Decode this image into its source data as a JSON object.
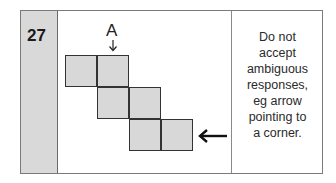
{
  "question": {
    "number": "27",
    "label": "A",
    "answer_note_lines": [
      "Do not",
      "accept",
      "ambiguous",
      "responses,",
      "eg arrow",
      "pointing to",
      "a corner."
    ]
  },
  "diagram": {
    "squares": [
      {
        "row": 0,
        "col": 0
      },
      {
        "row": 0,
        "col": 1
      },
      {
        "row": 1,
        "col": 1
      },
      {
        "row": 1,
        "col": 2
      },
      {
        "row": 2,
        "col": 2
      },
      {
        "row": 2,
        "col": 3
      }
    ],
    "fill_color": "#d8d8d8",
    "border_color": "#333333"
  }
}
